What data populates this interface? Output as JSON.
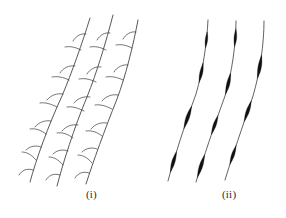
{
  "figure": {
    "background_color": "#ffffff",
    "stroke_color": "#3a3a3a",
    "fill_color": "#111111",
    "caption_color": "#2b2b2b",
    "width": 286,
    "height": 218,
    "panels": [
      {
        "id": "panel-i",
        "caption": "(i)",
        "caption_x": 86,
        "caption_y": 188,
        "description": "three curved stems bearing short lateral spurs",
        "stems": [
          {
            "name": "stem-left",
            "path": "M 30 182 C 36 160 48 126 62 96 C 72 72 82 44 90 18",
            "spurs": [
              {
                "path": "M 33 170 C 27 168 22 170 19 175"
              },
              {
                "path": "M 36 160 C 32 155 27 152 22 152"
              },
              {
                "path": "M 41 147 C 36 145 30 146 26 150"
              },
              {
                "path": "M 46 134 C 41 130 35 128 30 129"
              },
              {
                "path": "M 51 121 C 45 120 39 122 35 127"
              },
              {
                "path": "M 57 107 C 51 104 45 102 40 103"
              },
              {
                "path": "M 63 94 C 57 93 51 95 47 100"
              },
              {
                "path": "M 69 80 C 63 77 57 76 52 77"
              },
              {
                "path": "M 75 66 C 69 65 63 68 60 73"
              },
              {
                "path": "M 81 50 C 75 47 70 46 65 47"
              },
              {
                "path": "M 86 34 C 81 33 76 36 73 41"
              }
            ]
          },
          {
            "name": "stem-middle",
            "path": "M 57 186 C 63 163 74 128 87 97 C 97 72 106 42 113 15",
            "spurs": [
              {
                "path": "M 60 175 C 54 173 49 175 46 180"
              },
              {
                "path": "M 63 165 C 59 160 54 157 49 157"
              },
              {
                "path": "M 68 151 C 63 149 57 150 53 154"
              },
              {
                "path": "M 73 138 C 68 134 62 132 57 133"
              },
              {
                "path": "M 78 125 C 72 124 66 126 62 131"
              },
              {
                "path": "M 84 111 C 78 108 72 106 67 107"
              },
              {
                "path": "M 90 97 C 84 96 78 98 74 103"
              },
              {
                "path": "M 96 82 C 90 79 84 78 79 79"
              },
              {
                "path": "M 101 67 C 96 66 90 69 87 74"
              },
              {
                "path": "M 106 50 C 100 47 95 46 90 47"
              },
              {
                "path": "M 110 33 C 105 32 100 35 97 40"
              }
            ]
          },
          {
            "name": "stem-right",
            "path": "M 86 184 C 93 162 105 129 117 99 C 126 75 133 46 138 20",
            "spurs": [
              {
                "path": "M 89 173 C 83 171 78 173 75 178"
              },
              {
                "path": "M 92 163 C 88 158 83 155 78 155"
              },
              {
                "path": "M 97 149 C 92 147 86 148 82 152"
              },
              {
                "path": "M 102 136 C 97 132 91 130 86 131"
              },
              {
                "path": "M 107 123 C 101 122 95 124 91 129"
              },
              {
                "path": "M 112 109 C 106 106 100 104 95 105"
              },
              {
                "path": "M 118 95 C 112 94 106 96 102 101"
              },
              {
                "path": "M 123 80 C 117 77 111 76 106 77"
              },
              {
                "path": "M 128 65 C 123 64 117 67 114 72"
              },
              {
                "path": "M 132 48 C 126 45 121 44 116 45"
              },
              {
                "path": "M 136 32 C 131 31 126 34 123 39"
              }
            ]
          }
        ]
      },
      {
        "id": "panel-ii",
        "caption": "(ii)",
        "caption_x": 222,
        "caption_y": 188,
        "description": "three curved stems bearing elongate dark fusiform swellings",
        "stems": [
          {
            "name": "stem-left",
            "path": "M 168 181 C 174 158 185 124 196 94 C 203 70 207 42 208 20",
            "swellings": [
              {
                "center_t": 0.12,
                "length": 22,
                "max_width": 3.2
              },
              {
                "center_t": 0.4,
                "length": 24,
                "max_width": 3.4
              },
              {
                "center_t": 0.68,
                "length": 20,
                "max_width": 2.9
              },
              {
                "center_t": 0.88,
                "length": 16,
                "max_width": 2.4
              }
            ]
          },
          {
            "name": "stem-middle",
            "path": "M 196 182 C 203 159 214 126 225 96 C 232 72 236 44 236 21",
            "swellings": [
              {
                "center_t": 0.1,
                "length": 24,
                "max_width": 3.4
              },
              {
                "center_t": 0.36,
                "length": 20,
                "max_width": 3.0
              },
              {
                "center_t": 0.62,
                "length": 22,
                "max_width": 3.2
              },
              {
                "center_t": 0.9,
                "length": 18,
                "max_width": 2.6
              }
            ]
          },
          {
            "name": "stem-right",
            "path": "M 225 180 C 232 157 243 125 253 96 C 260 72 264 44 264 21",
            "swellings": [
              {
                "center_t": 0.16,
                "length": 20,
                "max_width": 3.0
              },
              {
                "center_t": 0.44,
                "length": 22,
                "max_width": 3.2
              },
              {
                "center_t": 0.72,
                "length": 24,
                "max_width": 3.4
              }
            ]
          }
        ]
      }
    ]
  }
}
